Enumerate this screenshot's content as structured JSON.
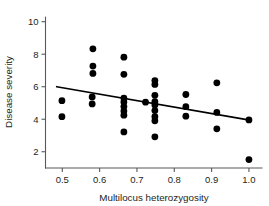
{
  "chart_data": {
    "type": "scatter",
    "title": "",
    "xlabel": "Multilocus heterozygosity",
    "ylabel": "Disease severity",
    "xlim": [
      0.455,
      1.035
    ],
    "ylim": [
      1.0,
      10.35
    ],
    "grid": false,
    "legend": null,
    "xticks": [
      0.5,
      0.6,
      0.7,
      0.8,
      0.9,
      1.0
    ],
    "xtick_labels": [
      "0.5",
      "0.6",
      "0.7",
      "0.8",
      "0.9",
      "1.0"
    ],
    "yticks": [
      2,
      4,
      6,
      8,
      10
    ],
    "ytick_labels": [
      "2",
      "4",
      "6",
      "8",
      "10"
    ],
    "marker": "filled-circle",
    "marker_color": "#000000",
    "marker_size_px": 3.4,
    "points": [
      {
        "x": 0.499,
        "y": 5.14
      },
      {
        "x": 0.499,
        "y": 4.16
      },
      {
        "x": 0.582,
        "y": 8.33
      },
      {
        "x": 0.582,
        "y": 7.27
      },
      {
        "x": 0.582,
        "y": 6.82
      },
      {
        "x": 0.58,
        "y": 5.37
      },
      {
        "x": 0.58,
        "y": 4.94
      },
      {
        "x": 0.665,
        "y": 7.82
      },
      {
        "x": 0.665,
        "y": 6.76
      },
      {
        "x": 0.665,
        "y": 5.3
      },
      {
        "x": 0.665,
        "y": 5.06
      },
      {
        "x": 0.665,
        "y": 4.78
      },
      {
        "x": 0.665,
        "y": 4.5
      },
      {
        "x": 0.665,
        "y": 4.25
      },
      {
        "x": 0.665,
        "y": 3.22
      },
      {
        "x": 0.723,
        "y": 5.05
      },
      {
        "x": 0.748,
        "y": 6.38
      },
      {
        "x": 0.748,
        "y": 6.14
      },
      {
        "x": 0.748,
        "y": 5.47
      },
      {
        "x": 0.748,
        "y": 5.08
      },
      {
        "x": 0.748,
        "y": 4.87
      },
      {
        "x": 0.748,
        "y": 4.53
      },
      {
        "x": 0.748,
        "y": 4.16
      },
      {
        "x": 0.748,
        "y": 3.9
      },
      {
        "x": 0.748,
        "y": 2.92
      },
      {
        "x": 0.831,
        "y": 5.52
      },
      {
        "x": 0.831,
        "y": 4.77
      },
      {
        "x": 0.831,
        "y": 4.19
      },
      {
        "x": 0.914,
        "y": 6.24
      },
      {
        "x": 0.914,
        "y": 4.42
      },
      {
        "x": 0.914,
        "y": 3.41
      },
      {
        "x": 1.0,
        "y": 3.96
      },
      {
        "x": 1.0,
        "y": 1.52
      }
    ],
    "fit_line": {
      "label": "regression-line",
      "color": "#000000",
      "x0": 0.485,
      "y0": 6.0,
      "x1": 1.002,
      "y1": 3.95
    }
  }
}
